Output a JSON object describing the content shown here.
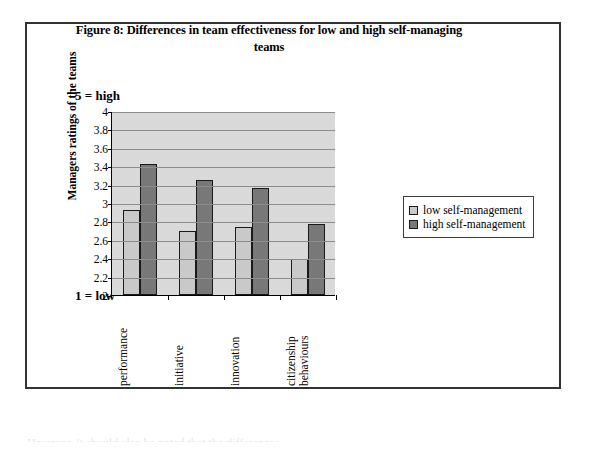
{
  "figure": {
    "title": "Figure 8: Differences in team effectiveness for low and high self-managing teams",
    "scale_high_label": "5 = high",
    "scale_low_label": "1 = low"
  },
  "chart_data": {
    "type": "bar",
    "title": "Figure 8: Differences in team effectiveness for low and high self-managing teams",
    "xlabel": "",
    "ylabel": "Managers ratings of the teams",
    "ylim": [
      2,
      4
    ],
    "ytick_step": 0.2,
    "yticks": [
      "4",
      "3.8",
      "3.6",
      "3.4",
      "3.2",
      "3",
      "2.8",
      "2.6",
      "2.4",
      "2.2",
      "2"
    ],
    "ytick_values": [
      4,
      3.8,
      3.6,
      3.4,
      3.2,
      3,
      2.8,
      2.6,
      2.4,
      2.2,
      2
    ],
    "grid": true,
    "legend_position": "right",
    "categories": [
      "performance",
      "initiative",
      "innovation",
      "citizenship behaviours"
    ],
    "category_lines": [
      [
        "performance"
      ],
      [
        "initiative"
      ],
      [
        "innovation"
      ],
      [
        "citizenship",
        "behaviours"
      ]
    ],
    "series": [
      {
        "name": "low self-management",
        "color": "#c9c9c9",
        "values": [
          2.92,
          2.7,
          2.74,
          2.39
        ]
      },
      {
        "name": "high self-management",
        "color": "#787878",
        "values": [
          3.42,
          3.25,
          3.16,
          2.77
        ]
      }
    ]
  },
  "page": {
    "cutoff_textline": "However, it should also be noted that the differences"
  }
}
